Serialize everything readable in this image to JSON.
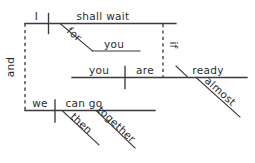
{
  "diagram": {
    "type": "reed-kellogg-sentence-diagram",
    "ink_color": "#3a3a3a",
    "text_color": "#2b2b2b",
    "background_color": "#ffffff",
    "clauses": {
      "main_upper": {
        "subject": "I",
        "predicate": "shall wait",
        "prep": "for",
        "prep_object": "you"
      },
      "subordinate": {
        "conjunction": "if",
        "subject": "you",
        "verb": "are",
        "predicate_adjective": "ready",
        "adverb": "almost"
      },
      "main_lower": {
        "subject": "we",
        "predicate": "can go",
        "adverb1": "then",
        "adverb2": "together"
      }
    },
    "coordinating_conjunction": "and",
    "labels": {
      "i": "I",
      "shall_wait": "shall wait",
      "for": "for",
      "you_prep_object": "you",
      "if": "if",
      "you_subject": "you",
      "are": "are",
      "ready": "ready",
      "almost": "almost",
      "and": "and",
      "we": "we",
      "can_go": "can go",
      "then": "then",
      "together": "together"
    }
  }
}
